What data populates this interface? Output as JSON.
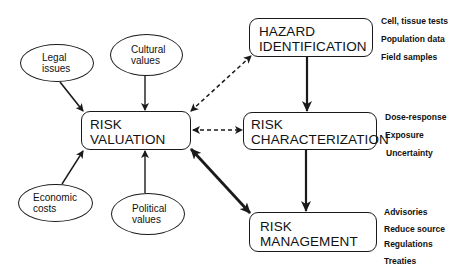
{
  "diagram": {
    "influences": [
      {
        "id": "legal",
        "line1": "Legal",
        "line2": "issues"
      },
      {
        "id": "cultural",
        "line1": "Cultural",
        "line2": "values"
      },
      {
        "id": "economic",
        "line1": "Economic",
        "line2": "costs"
      },
      {
        "id": "political",
        "line1": "Political",
        "line2": "values"
      }
    ],
    "boxes": {
      "valuation": {
        "line1": "RISK",
        "line2": "VALUATION"
      },
      "hazard": {
        "line1": "HAZARD",
        "line2": "IDENTIFICATION"
      },
      "characterization": {
        "line1": "RISK",
        "line2": "CHARACTERIZATION"
      },
      "management": {
        "line1": "RISK",
        "line2": "MANAGEMENT"
      }
    },
    "notes": {
      "hazard": [
        "Cell, tissue tests",
        "Population data",
        "Field samples"
      ],
      "characterization": [
        "Dose-response",
        "Exposure",
        "Uncertainty"
      ],
      "management": [
        "Advisories",
        "Reduce source",
        "Regulations",
        "Treaties"
      ]
    },
    "connections": [
      {
        "from": "Legal issues",
        "to": "RISK VALUATION",
        "style": "solid"
      },
      {
        "from": "Cultural values",
        "to": "RISK VALUATION",
        "style": "solid"
      },
      {
        "from": "Economic costs",
        "to": "RISK VALUATION",
        "style": "solid"
      },
      {
        "from": "Political values",
        "to": "RISK VALUATION",
        "style": "solid"
      },
      {
        "from": "RISK VALUATION",
        "to": "HAZARD IDENTIFICATION",
        "style": "dashed-bidirectional"
      },
      {
        "from": "RISK VALUATION",
        "to": "RISK CHARACTERIZATION",
        "style": "dashed-bidirectional"
      },
      {
        "from": "RISK VALUATION",
        "to": "RISK MANAGEMENT",
        "style": "thick-bidirectional"
      },
      {
        "from": "HAZARD IDENTIFICATION",
        "to": "RISK CHARACTERIZATION",
        "style": "thick"
      },
      {
        "from": "RISK CHARACTERIZATION",
        "to": "RISK MANAGEMENT",
        "style": "thick"
      }
    ],
    "colors": {
      "line": "#1a1a1a",
      "background": "#ffffff"
    }
  }
}
